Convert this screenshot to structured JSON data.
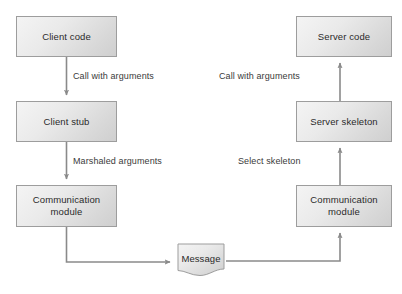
{
  "diagram": {
    "type": "flowchart",
    "colors": {
      "node_border": "#9d9d9d",
      "node_fill_light": "#f4f4f4",
      "node_fill_dark": "#cfcfcf",
      "line": "#8a8a8a",
      "label_text": "#3a3a3a",
      "node_text": "#2a2a2a",
      "background": "#ffffff"
    },
    "nodes": [
      {
        "id": "client_code",
        "label": "Client code",
        "shape": "rectangle",
        "x": 16,
        "y": 16,
        "w": 101,
        "h": 41
      },
      {
        "id": "client_stub",
        "label": "Client stub",
        "shape": "rectangle",
        "x": 16,
        "y": 101,
        "w": 101,
        "h": 41
      },
      {
        "id": "client_comm",
        "label": "Communication module",
        "line1": "Communication",
        "line2": "module",
        "shape": "rectangle",
        "x": 16,
        "y": 185,
        "w": 101,
        "h": 42
      },
      {
        "id": "server_code",
        "label": "Server code",
        "shape": "rectangle",
        "x": 296,
        "y": 16,
        "w": 96,
        "h": 41
      },
      {
        "id": "server_skeleton",
        "label": "Server skeleton",
        "shape": "rectangle",
        "x": 296,
        "y": 101,
        "w": 96,
        "h": 41
      },
      {
        "id": "server_comm",
        "label": "Communication module",
        "line1": "Communication",
        "line2": "module",
        "shape": "rectangle",
        "x": 296,
        "y": 185,
        "w": 96,
        "h": 42
      },
      {
        "id": "message",
        "label": "Message",
        "shape": "document",
        "x": 176,
        "y": 243,
        "w": 50,
        "h": 34
      }
    ],
    "edges": [
      {
        "id": "e1",
        "from": "client_code",
        "to": "client_stub",
        "label": "Call with arguments",
        "label_x": 72,
        "label_y": 72,
        "direction": "down"
      },
      {
        "id": "e2",
        "from": "client_stub",
        "to": "client_comm",
        "label": "Marshaled arguments",
        "label_x": 72,
        "label_y": 157,
        "direction": "down"
      },
      {
        "id": "e3",
        "from": "client_comm",
        "to": "message",
        "label": "",
        "direction": "down-right"
      },
      {
        "id": "e4",
        "from": "message",
        "to": "server_comm",
        "label": "",
        "direction": "right-up"
      },
      {
        "id": "e5",
        "from": "server_comm",
        "to": "server_skeleton",
        "label": "Select skeleton",
        "label_x": 240,
        "label_y": 157,
        "direction": "up"
      },
      {
        "id": "e6",
        "from": "server_skeleton",
        "to": "server_code",
        "label": "Call with arguments",
        "label_x": 222,
        "label_y": 72,
        "direction": "up"
      }
    ]
  }
}
